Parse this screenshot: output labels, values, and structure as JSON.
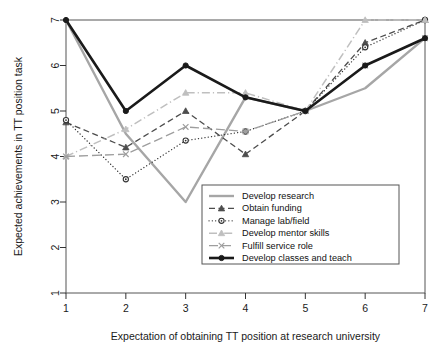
{
  "chart_data": {
    "type": "line",
    "title": "",
    "xlabel": "Expectation of obtaining TT position at research university",
    "ylabel": "Expected achievements in TT position task",
    "x": [
      1,
      2,
      3,
      4,
      5,
      6,
      7
    ],
    "xlim": [
      1,
      7
    ],
    "ylim": [
      1,
      7
    ],
    "xticks": [
      "1",
      "2",
      "3",
      "4",
      "5",
      "6",
      "7"
    ],
    "yticks": [
      "1",
      "2",
      "3",
      "4",
      "5",
      "6",
      "7"
    ],
    "grid": false,
    "legend_position": "bottom-right",
    "series": [
      {
        "name": "Develop research",
        "values": [
          7.0,
          4.5,
          3.0,
          5.3,
          5.0,
          5.5,
          6.6
        ],
        "color": "#a6a6a6",
        "style": "solid",
        "marker": "none",
        "width": 2.4
      },
      {
        "name": "Obtain funding",
        "values": [
          4.75,
          4.2,
          5.0,
          4.05,
          5.0,
          6.5,
          7.0
        ],
        "color": "#4d4d4d",
        "style": "dashed",
        "marker": "triangle",
        "width": 1.3
      },
      {
        "name": "Manage lab/field",
        "values": [
          4.8,
          3.5,
          4.35,
          4.55,
          5.0,
          6.4,
          7.0
        ],
        "color": "#333333",
        "style": "dotted",
        "marker": "circle",
        "width": 1.3
      },
      {
        "name": "Develop mentor skills",
        "values": [
          4.0,
          4.6,
          5.4,
          5.4,
          5.0,
          7.0,
          7.0
        ],
        "color": "#bfbfbf",
        "style": "dashdot",
        "marker": "triangle",
        "width": 1.5
      },
      {
        "name": "Fulfill service role",
        "values": [
          4.0,
          4.05,
          4.65,
          4.55,
          5.0,
          6.0,
          6.6
        ],
        "color": "#9e9e9e",
        "style": "longdash",
        "marker": "cross",
        "width": 1.3
      },
      {
        "name": "Develop classes and teach",
        "values": [
          7.0,
          5.0,
          6.0,
          5.3,
          5.0,
          6.0,
          6.6
        ],
        "color": "#1a1a1a",
        "style": "solid",
        "marker": "dot",
        "width": 2.6
      }
    ]
  },
  "legend": {
    "entries": [
      "Develop research",
      "Obtain funding",
      "Manage lab/field",
      "Develop mentor skills",
      "Fulfill service role",
      "Develop classes and teach"
    ]
  }
}
